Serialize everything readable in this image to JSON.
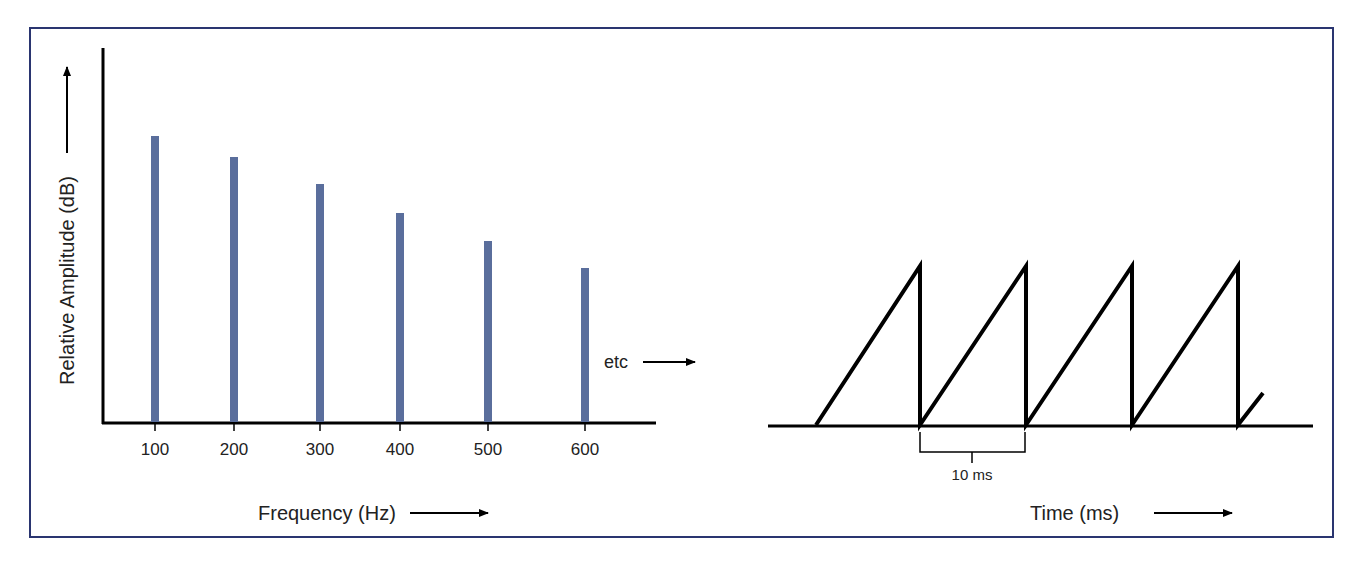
{
  "frame": {
    "border_color": "#2a3570"
  },
  "chart_data": [
    {
      "type": "bar",
      "title": "",
      "categories": [
        "100",
        "200",
        "300",
        "400",
        "500",
        "600"
      ],
      "values": [
        286,
        265,
        238,
        209,
        181,
        154
      ],
      "value_note": "relative amplitude (px height above baseline; no numeric y ticks shown)",
      "xlabel": "Frequency (Hz)",
      "ylabel": "Relative Amplitude (dB)",
      "annotation": "etc",
      "bar_color": "#5a6e9c",
      "grid": false,
      "legend": null
    },
    {
      "type": "line",
      "title": "",
      "subtype": "sawtooth waveform",
      "xlabel": "Time (ms)",
      "ylabel": "",
      "period_label": "10 ms",
      "cycles_shown": 4,
      "x": [
        0,
        10,
        10,
        20,
        20,
        30,
        30,
        40,
        40,
        42.4
      ],
      "y": [
        0,
        1,
        0,
        1,
        0,
        1,
        0,
        1,
        0,
        0.2
      ],
      "line_color": "#000000",
      "grid": false,
      "legend": null
    }
  ],
  "labels": {
    "y_axis_left": "Relative Amplitude (dB)",
    "x_axis_left": "Frequency (Hz)",
    "etc": "etc",
    "x_axis_right": "Time (ms)",
    "period": "10 ms",
    "ticks": [
      "100",
      "200",
      "300",
      "400",
      "500",
      "600"
    ]
  }
}
